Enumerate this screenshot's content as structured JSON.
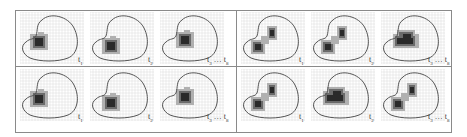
{
  "figure": {
    "groups": [
      {
        "name": "left",
        "rows": [
          {
            "panels": [
              {
                "label": "t1",
                "blob": "single"
              },
              {
                "label": "t2",
                "blob": "single"
              },
              {
                "label": "t3 … t8",
                "blob": "single"
              }
            ]
          },
          {
            "panels": [
              {
                "label": "t1",
                "blob": "single"
              },
              {
                "label": "t2",
                "blob": "single"
              },
              {
                "label": "t3 … t8",
                "blob": "single"
              }
            ]
          }
        ]
      },
      {
        "name": "right",
        "rows": [
          {
            "panels": [
              {
                "label": "t1",
                "blob": "double"
              },
              {
                "label": "t2",
                "blob": "double"
              },
              {
                "label": "t3 … t8",
                "blob": "elongated"
              }
            ]
          },
          {
            "panels": [
              {
                "label": "t1",
                "blob": "double"
              },
              {
                "label": "t2",
                "blob": "elongated"
              },
              {
                "label": "t3 … t8",
                "blob": "double"
              }
            ]
          }
        ]
      }
    ],
    "labels": {
      "t1": "t",
      "t1_sub": "1",
      "t2": "t",
      "t2_sub": "2",
      "t3": "t",
      "t3_sub": "3",
      "ellipsis": "…",
      "t8": "t",
      "t8_sub": "8"
    },
    "colors": {
      "frame": "#8a8a8a",
      "grid": "#d8d8d8",
      "outline": "#555555",
      "heat_dark": "#2a2a2a",
      "heat_mid": "#6a6a6a",
      "heat_light": "#b0b0b0"
    }
  }
}
